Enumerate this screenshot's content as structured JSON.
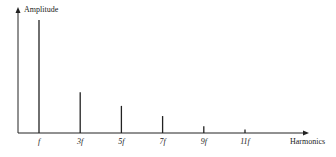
{
  "chart_data": {
    "type": "bar",
    "title": "",
    "xlabel": "Harmonics",
    "ylabel": "Amplitude",
    "categories": [
      "f",
      "3f",
      "5f",
      "7f",
      "9f",
      "11f"
    ],
    "values": [
      1.0,
      0.36,
      0.24,
      0.15,
      0.06,
      0.03
    ],
    "ylim": [
      0,
      1.1
    ],
    "grid": false,
    "legend": null,
    "style": "stem lines (spectral lines)",
    "colors": {
      "line": "#222222",
      "background": "#ffffff"
    }
  },
  "labels": {
    "y_axis": "Amplitude",
    "x_axis": "Harmonics",
    "ticks": [
      "f",
      "3f",
      "5f",
      "7f",
      "9f",
      "11f"
    ]
  }
}
